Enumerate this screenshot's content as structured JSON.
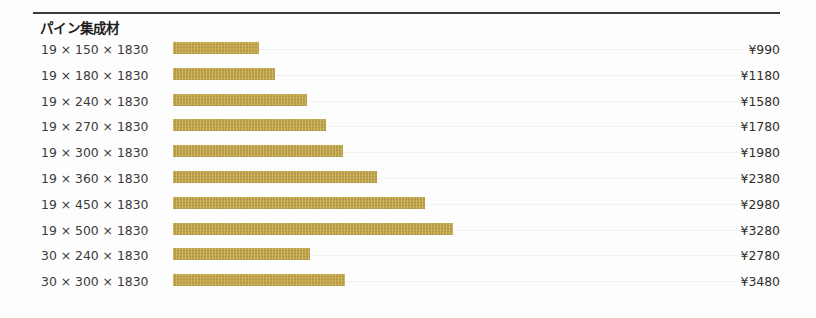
{
  "chart_title": "パイン集成材",
  "currency_symbol": "¥",
  "colors": {
    "bar": "#bfa244",
    "rule": "#3a3a3a",
    "label_text": "#3b3b3b",
    "price_text": "#2f2f2f",
    "background": "#fdfdfd",
    "leader": "#e9e9e9"
  },
  "chart_data": {
    "type": "bar",
    "title": "パイン集成材",
    "xlabel": "",
    "ylabel": "",
    "orientation": "horizontal",
    "grid": false,
    "legend": "none",
    "xlim": [
      0,
      4000
    ],
    "categories": [
      "19 × 150 × 1830",
      "19 × 180 × 1830",
      "19 × 240 × 1830",
      "19 × 270 × 1830",
      "19 × 300 × 1830",
      "19 × 360 × 1830",
      "19 × 450 × 1830",
      "19 × 500 × 1830",
      "30 × 240 × 1830",
      "30 × 300 × 1830"
    ],
    "values": [
      990,
      1180,
      1580,
      1780,
      1980,
      2380,
      2980,
      3280,
      2780,
      3480
    ],
    "value_labels": [
      "¥990",
      "¥1180",
      "¥1580",
      "¥1780",
      "¥1980",
      "¥2380",
      "¥2980",
      "¥3280",
      "¥2780",
      "¥3480"
    ]
  },
  "rows": [
    {
      "label": "19 × 150 × 1830",
      "price": "¥990",
      "value": 990,
      "bar_px": 86
    },
    {
      "label": "19 × 180 × 1830",
      "price": "¥1180",
      "value": 1180,
      "bar_px": 102
    },
    {
      "label": "19 × 240 × 1830",
      "price": "¥1580",
      "value": 1580,
      "bar_px": 134
    },
    {
      "label": "19 × 270 × 1830",
      "price": "¥1780",
      "value": 1780,
      "bar_px": 153
    },
    {
      "label": "19 × 300 × 1830",
      "price": "¥1980",
      "value": 1980,
      "bar_px": 170
    },
    {
      "label": "19 × 360 × 1830",
      "price": "¥2380",
      "value": 2380,
      "bar_px": 204
    },
    {
      "label": "19 × 450 × 1830",
      "price": "¥2980",
      "value": 2980,
      "bar_px": 252
    },
    {
      "label": "19 × 500 × 1830",
      "price": "¥3280",
      "value": 3280,
      "bar_px": 280
    },
    {
      "label": "30 × 240 × 1830",
      "price": "¥2780",
      "value": 2780,
      "bar_px": 137
    },
    {
      "label": "30 × 300 × 1830",
      "price": "¥3480",
      "value": 3480,
      "bar_px": 172
    }
  ]
}
